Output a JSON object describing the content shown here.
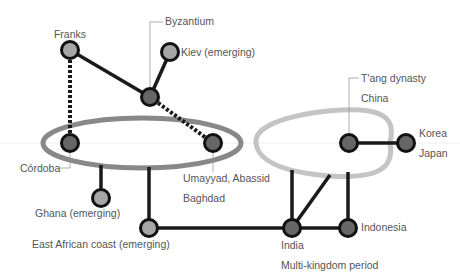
{
  "diagram": {
    "type": "network",
    "colors": {
      "edge": "#1a1a1a",
      "node_dark": "#666666",
      "node_light": "#a6a6a6",
      "node_stroke": "#111111",
      "islamic_ellipse": "#888888",
      "china_loop": "#c4c4c4",
      "leader": "#999999",
      "label": "#555555",
      "baseline": "#eeeeee"
    },
    "nodes": [
      {
        "id": "franks",
        "x": 70,
        "y": 50,
        "fill": "light",
        "labels": [
          "Franks"
        ],
        "label_x": 70,
        "label_y": 38,
        "anchor": "middle"
      },
      {
        "id": "kiev",
        "x": 170,
        "y": 52,
        "fill": "light",
        "labels": [
          "Kiev (emerging)"
        ],
        "label_x": 181,
        "label_y": 56,
        "anchor": "start"
      },
      {
        "id": "byzantium",
        "x": 150,
        "y": 97,
        "fill": "dark",
        "labels": [
          "Byzantium"
        ],
        "label_x": 165,
        "label_y": 25,
        "anchor": "start"
      },
      {
        "id": "cordoba",
        "x": 70,
        "y": 143,
        "fill": "dark",
        "labels": [
          "Córdoba"
        ],
        "label_x": 20,
        "label_y": 172,
        "anchor": "start"
      },
      {
        "id": "baghdad",
        "x": 213,
        "y": 143,
        "fill": "dark",
        "labels": [
          "Umayyad, Abassid",
          "Baghdad"
        ],
        "label_x": 183,
        "label_y": 182,
        "anchor": "start"
      },
      {
        "id": "ghana",
        "x": 101,
        "y": 198,
        "fill": "light",
        "labels": [
          "Ghana (emerging)"
        ],
        "label_x": 35,
        "label_y": 217,
        "anchor": "start"
      },
      {
        "id": "east_africa",
        "x": 149,
        "y": 228,
        "fill": "light",
        "labels": [
          "East African coast (emerging)"
        ],
        "label_x": 32,
        "label_y": 248,
        "anchor": "start"
      },
      {
        "id": "china",
        "x": 349,
        "y": 143,
        "fill": "dark",
        "labels": [
          "T'ang dynasty",
          "China"
        ],
        "label_x": 361,
        "label_y": 82,
        "anchor": "start"
      },
      {
        "id": "korea_japan",
        "x": 406,
        "y": 143,
        "fill": "dark",
        "labels": [
          "Korea",
          "Japan"
        ],
        "label_x": 419,
        "label_y": 137,
        "anchor": "start"
      },
      {
        "id": "india",
        "x": 292,
        "y": 228,
        "fill": "dark",
        "labels": [
          "India",
          "Multi-kingdom period"
        ],
        "label_x": 281,
        "label_y": 249,
        "anchor": "start"
      },
      {
        "id": "indonesia",
        "x": 348,
        "y": 228,
        "fill": "dark",
        "labels": [
          "Indonesia"
        ],
        "label_x": 361,
        "label_y": 231,
        "anchor": "start"
      }
    ],
    "edges": [
      {
        "from": "franks",
        "to": "byzantium",
        "style": "solid"
      },
      {
        "from": "kiev",
        "to": "byzantium",
        "style": "solid"
      },
      {
        "from": "franks",
        "to": "cordoba",
        "style": "dashed"
      },
      {
        "from": "byzantium",
        "to": "baghdad",
        "style": "dashed"
      },
      {
        "from": "china",
        "to": "korea_japan",
        "style": "solid"
      },
      {
        "from": "east_africa",
        "to": "india",
        "style": "solid"
      },
      {
        "from": "india",
        "to": "indonesia",
        "style": "solid"
      }
    ],
    "connectors": [
      {
        "name": "ghana-to-islamic",
        "x1": 101,
        "y1": 165,
        "x2": 101,
        "y2": 198
      },
      {
        "name": "east-africa-to-islamic",
        "x1": 149,
        "y1": 167,
        "x2": 149,
        "y2": 228
      },
      {
        "name": "india-to-china-left",
        "x1": 292,
        "y1": 170,
        "x2": 292,
        "y2": 228
      },
      {
        "name": "india-to-china-diagonal",
        "x1": 330,
        "y1": 175,
        "x2": 292,
        "y2": 228
      },
      {
        "name": "indonesia-to-china",
        "x1": 348,
        "y1": 172,
        "x2": 348,
        "y2": 228
      }
    ],
    "leaders": [
      {
        "name": "byzantium-leader",
        "points": "163,22 150,22 150,90"
      },
      {
        "name": "cordoba-leader",
        "points": "59,168 70,168 70,150"
      },
      {
        "name": "baghdad-leader",
        "points": "213,150 213,172"
      },
      {
        "name": "china-leader",
        "points": "359,78 349,78 349,136"
      }
    ],
    "regions": [
      {
        "name": "islamic-world-ellipse",
        "cx": 142,
        "cy": 143,
        "rx": 99,
        "ry": 25
      },
      {
        "name": "china-loop",
        "path": "M 256,143 C 252,118 330,108 360,110 C 395,112 393,130 390,143 C 393,160 390,180 330,176 C 280,172 258,160 256,143 Z"
      }
    ]
  }
}
